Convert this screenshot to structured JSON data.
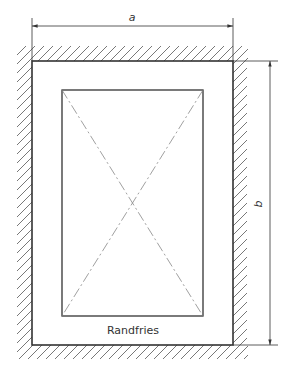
{
  "diagram": {
    "type": "technical-drawing",
    "labels": {
      "width_dimension": "a",
      "height_dimension": "b",
      "border_frieze": "Randfries"
    },
    "colors": {
      "stroke": "#333333",
      "centerline": "#999999",
      "background": "#ffffff"
    },
    "elements": [
      {
        "id": "outer-frame",
        "kind": "rectangle",
        "x": 32,
        "y": 61,
        "w": 201,
        "h": 284
      },
      {
        "id": "inner-panel",
        "kind": "rectangle",
        "x": 62,
        "y": 90,
        "w": 141,
        "h": 226
      },
      {
        "id": "diagonal-1",
        "kind": "dash-dot-line",
        "from": [
          62,
          90
        ],
        "to": [
          203,
          316
        ]
      },
      {
        "id": "diagonal-2",
        "kind": "dash-dot-line",
        "from": [
          203,
          90
        ],
        "to": [
          62,
          316
        ]
      },
      {
        "id": "dimension-a",
        "kind": "dimension",
        "axis": "horizontal",
        "from": 32,
        "to": 233,
        "at": 26,
        "label": "a"
      },
      {
        "id": "dimension-b",
        "kind": "dimension",
        "axis": "vertical",
        "from": 61,
        "to": 345,
        "at": 270,
        "label": "b"
      },
      {
        "id": "wall-hatching",
        "kind": "hatching",
        "surrounds": "outer-frame"
      }
    ]
  }
}
